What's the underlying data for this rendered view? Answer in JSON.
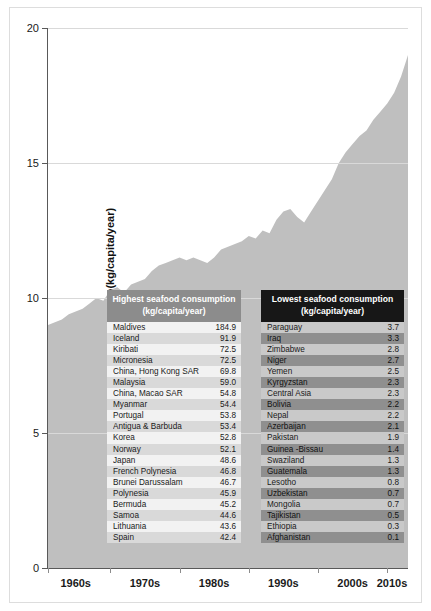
{
  "chart_data": {
    "type": "area",
    "title": "",
    "xlabel": "",
    "ylabel": "Seafood consumption(kg/capita/year)",
    "ylim": [
      0,
      20
    ],
    "yticks": [
      0,
      5,
      10,
      15,
      20
    ],
    "ytick_labels": [
      "0",
      "5",
      "10",
      "15",
      "20"
    ],
    "xtick_labels": [
      "1960s",
      "1970s",
      "1980s",
      "1990s",
      "2000s",
      "2010s"
    ],
    "grid": true,
    "legend": "none",
    "area_color": "#bfbfbf",
    "x": [
      1961,
      1962,
      1963,
      1964,
      1965,
      1966,
      1967,
      1968,
      1969,
      1970,
      1971,
      1972,
      1973,
      1974,
      1975,
      1976,
      1977,
      1978,
      1979,
      1980,
      1981,
      1982,
      1983,
      1984,
      1985,
      1986,
      1987,
      1988,
      1989,
      1990,
      1991,
      1992,
      1993,
      1994,
      1995,
      1996,
      1997,
      1998,
      1999,
      2000,
      2001,
      2002,
      2003,
      2004,
      2005,
      2006,
      2007,
      2008,
      2009,
      2010,
      2011,
      2012,
      2013
    ],
    "values": [
      9.0,
      9.1,
      9.2,
      9.4,
      9.5,
      9.6,
      9.8,
      10.0,
      9.9,
      10.3,
      10.4,
      10.2,
      10.5,
      10.6,
      10.7,
      11.0,
      11.2,
      11.3,
      11.4,
      11.5,
      11.4,
      11.5,
      11.4,
      11.3,
      11.5,
      11.8,
      11.9,
      12.0,
      12.1,
      12.3,
      12.2,
      12.5,
      12.4,
      12.9,
      13.2,
      13.3,
      13.0,
      12.8,
      13.2,
      13.6,
      14.0,
      14.4,
      15.0,
      15.4,
      15.7,
      16.0,
      16.2,
      16.6,
      16.9,
      17.2,
      17.6,
      18.2,
      19.0
    ]
  },
  "highest": {
    "title_line1": "Highest seafood consumption",
    "title_line2": "(kg/capita/year)",
    "rows": [
      {
        "name": "Maldives",
        "value": "184.9"
      },
      {
        "name": "Iceland",
        "value": "91.9"
      },
      {
        "name": "Kiribati",
        "value": "72.5"
      },
      {
        "name": "Micronesia",
        "value": "72.5"
      },
      {
        "name": "China, Hong Kong SAR",
        "value": "69.8"
      },
      {
        "name": "Malaysia",
        "value": "59.0"
      },
      {
        "name": "China, Macao SAR",
        "value": "54.8"
      },
      {
        "name": "Myanmar",
        "value": "54.4"
      },
      {
        "name": "Portugal",
        "value": "53.8"
      },
      {
        "name": "Antigua & Barbuda",
        "value": "53.4"
      },
      {
        "name": "Korea",
        "value": "52.8"
      },
      {
        "name": "Norway",
        "value": "52.1"
      },
      {
        "name": "Japan",
        "value": "48.6"
      },
      {
        "name": "French Polynesia",
        "value": "46.8"
      },
      {
        "name": "Brunei Darussalam",
        "value": "46.7"
      },
      {
        "name": "Polynesia",
        "value": "45.9"
      },
      {
        "name": "Bermuda",
        "value": "45.2"
      },
      {
        "name": "Samoa",
        "value": "44.6"
      },
      {
        "name": "Lithuania",
        "value": "43.6"
      },
      {
        "name": "Spain",
        "value": "42.4"
      }
    ]
  },
  "lowest": {
    "title_line1": "Lowest seafood consumption",
    "title_line2": "(kg/capita/year)",
    "rows": [
      {
        "name": "Paraguay",
        "value": "3.7"
      },
      {
        "name": "Iraq",
        "value": "3.3"
      },
      {
        "name": "Zimbabwe",
        "value": "2.8"
      },
      {
        "name": "Niger",
        "value": "2.7"
      },
      {
        "name": "Yemen",
        "value": "2.5"
      },
      {
        "name": "Kyrgyzstan",
        "value": "2.3"
      },
      {
        "name": "Central Asia",
        "value": "2.3"
      },
      {
        "name": "Bolivia",
        "value": "2.2"
      },
      {
        "name": "Nepal",
        "value": "2.2"
      },
      {
        "name": "Azerbaijan",
        "value": "2.1"
      },
      {
        "name": "Pakistan",
        "value": "1.9"
      },
      {
        "name": "Guinea -Bissau",
        "value": "1.4"
      },
      {
        "name": "Swaziland",
        "value": "1.3"
      },
      {
        "name": "Guatemala",
        "value": "1.3"
      },
      {
        "name": "Lesotho",
        "value": "0.8"
      },
      {
        "name": "Uzbekistan",
        "value": "0.7"
      },
      {
        "name": "Mongolia",
        "value": "0.7"
      },
      {
        "name": "Tajikistan",
        "value": "0.5"
      },
      {
        "name": "Ethiopia",
        "value": "0.3"
      },
      {
        "name": "Afghanistan",
        "value": "0.1"
      }
    ]
  }
}
